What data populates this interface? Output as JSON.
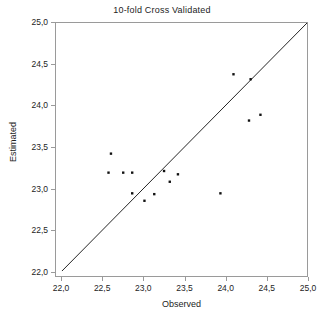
{
  "chart_data": {
    "type": "scatter",
    "title": "10-fold Cross Validated",
    "xlabel": "Observed",
    "ylabel": "Estimated",
    "xlim": [
      22.0,
      25.0
    ],
    "ylim": [
      22.0,
      25.0
    ],
    "grid": false,
    "legend": null,
    "xticks": [
      "22,0",
      "22,5",
      "23,0",
      "23,5",
      "24,0",
      "24,5",
      "25,0"
    ],
    "xtick_values": [
      22.0,
      22.5,
      23.0,
      23.5,
      24.0,
      24.5,
      25.0
    ],
    "yticks": [
      "22,0",
      "22,5",
      "23,0",
      "23,5",
      "24,0",
      "24,5",
      "25,0"
    ],
    "ytick_values": [
      22.0,
      22.5,
      23.0,
      23.5,
      24.0,
      24.5,
      25.0
    ],
    "decimal_separator": ",",
    "point_color": "#111111",
    "line_color": "#222222",
    "frame_color": "#9a9a9a",
    "reference_line": {
      "name": "identity-line",
      "from": [
        22.0,
        22.0
      ],
      "to": [
        25.0,
        25.0
      ],
      "description": "y = x diagonal"
    },
    "series": [
      {
        "name": "cross-validated-predictions",
        "x": [
          22.6,
          22.57,
          22.75,
          22.86,
          22.86,
          23.01,
          23.13,
          23.25,
          23.32,
          23.42,
          23.94,
          24.1,
          24.31,
          24.29,
          24.43
        ],
        "y": [
          23.42,
          23.19,
          23.19,
          23.19,
          22.94,
          22.85,
          22.93,
          23.21,
          23.08,
          23.17,
          22.94,
          24.38,
          24.32,
          23.82,
          23.89
        ]
      }
    ]
  }
}
